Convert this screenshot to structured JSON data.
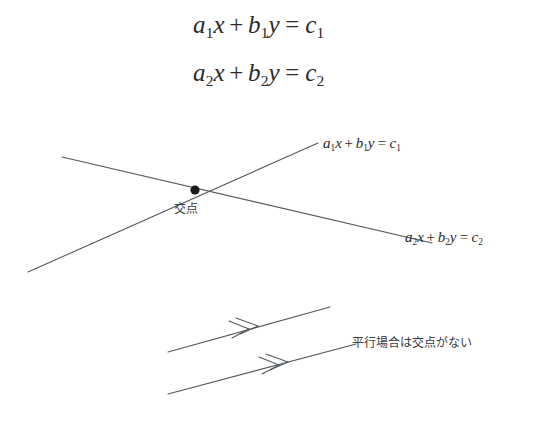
{
  "figure": {
    "kind": "geometry-diagram",
    "topic": "system-of-two-linear-equations",
    "background_color": "#ffffff",
    "line_color": "#555a5e",
    "text_color": "#2b2b2b",
    "dot_color": "#1a1a1a"
  },
  "display_equations": [
    {
      "id": "equation-1",
      "coef_a": "a",
      "sub_a": "1",
      "var_x": "x",
      "plus": "+",
      "coef_b": "b",
      "sub_b": "1",
      "var_y": "y",
      "equals": "=",
      "rhs": "c",
      "sub_c": "1"
    },
    {
      "id": "equation-2",
      "coef_a": "a",
      "sub_a": "2",
      "var_x": "x",
      "plus": "+",
      "coef_b": "b",
      "sub_b": "2",
      "var_y": "y",
      "equals": "=",
      "rhs": "c",
      "sub_c": "2"
    }
  ],
  "line_labels": [
    {
      "id": "label-line-1",
      "coef_a": "a",
      "sub_a": "1",
      "var_x": "x",
      "plus": "+",
      "coef_b": "b",
      "sub_b": "1",
      "var_y": "y",
      "equals": "=",
      "rhs": "c",
      "sub_c": "1"
    },
    {
      "id": "label-line-2",
      "coef_a": "a",
      "sub_a": "2",
      "var_x": "x",
      "plus": "+",
      "coef_b": "b",
      "sub_b": "2",
      "var_y": "y",
      "equals": "=",
      "rhs": "c",
      "sub_c": "2"
    }
  ],
  "annotations": {
    "intersection_label": "交点",
    "parallel_note": "平行場合は交点がない"
  },
  "geometry": {
    "intersecting_pair": {
      "ascending_line": {
        "x1": 28,
        "y1": 272,
        "x2": 318,
        "y2": 143
      },
      "descending_line": {
        "x1": 62,
        "y1": 157,
        "x2": 432,
        "y2": 243
      },
      "intersection_point": {
        "x": 195,
        "y": 190,
        "r": 4.6
      }
    },
    "parallel_pair": {
      "upper_line": {
        "x1": 168,
        "y1": 352,
        "x2": 330,
        "y2": 307
      },
      "lower_line": {
        "x1": 168,
        "y1": 394,
        "x2": 356,
        "y2": 344
      },
      "upper_arrow": {
        "x": 258,
        "y": 326
      },
      "lower_arrow": {
        "x": 288,
        "y": 362
      },
      "arrow_style": "double-chevron"
    }
  }
}
